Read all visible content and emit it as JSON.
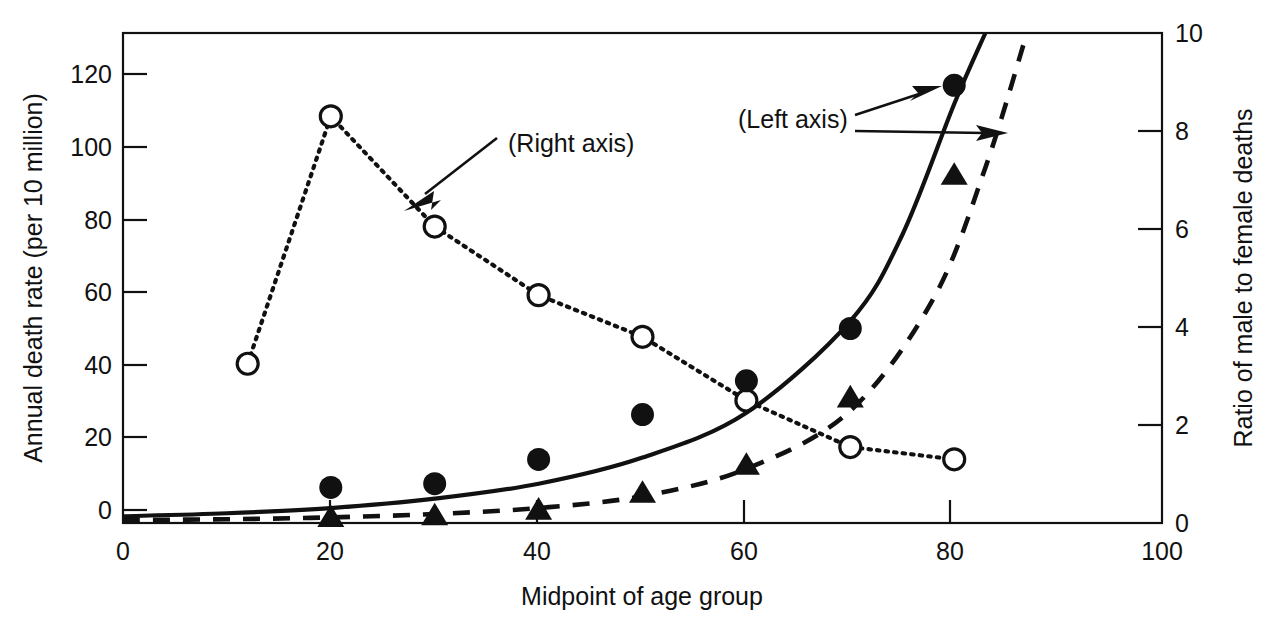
{
  "chart_data": {
    "type": "line",
    "title": "",
    "xlabel": "Midpoint of age group",
    "ylabel": "Annual death rate (per 10 million)",
    "y2label": "Ratio of male to female deaths",
    "xlim": [
      0,
      100
    ],
    "ylim": [
      0,
      131
    ],
    "y2lim": [
      0,
      10
    ],
    "xticks": [
      "0",
      "20",
      "40",
      "60",
      "80",
      "100"
    ],
    "xtick_values": [
      0,
      20,
      40,
      60,
      80,
      100
    ],
    "yticks": [
      "0",
      "20",
      "40",
      "60",
      "80",
      "100",
      "120"
    ],
    "ytick_values": [
      0,
      20,
      40,
      60,
      80,
      100,
      120
    ],
    "y2ticks": [
      "0",
      "2",
      "4",
      "6",
      "8",
      "10"
    ],
    "y2tick_values": [
      0,
      2,
      4,
      6,
      8,
      10
    ],
    "grid": false,
    "legend": "none",
    "annotations": [
      {
        "text": "(Right axis)",
        "points_to": "dotted-ratio-series"
      },
      {
        "text": "(Left axis)",
        "points_to": "solid-male-curve"
      },
      {
        "text": "(Left axis)",
        "points_to": "dashed-female-curve"
      }
    ],
    "series": [
      {
        "name": "Male death rate (points)",
        "axis": "left",
        "marker": "filled-circle",
        "line": "none",
        "x": [
          20,
          30,
          40,
          50,
          60,
          70,
          80
        ],
        "values": [
          9.5,
          10.5,
          17.0,
          29.0,
          38.0,
          52.0,
          117.0
        ]
      },
      {
        "name": "Male death rate (fitted)",
        "axis": "left",
        "marker": "none",
        "line": "solid",
        "x": [
          0,
          10,
          20,
          30,
          40,
          50,
          60,
          70,
          75,
          80,
          83
        ],
        "values": [
          1.8,
          2.6,
          4.0,
          6.5,
          10.5,
          17.5,
          29.5,
          54.0,
          77.0,
          112.0,
          131.0
        ]
      },
      {
        "name": "Female death rate (points)",
        "axis": "left",
        "marker": "filled-triangle",
        "line": "none",
        "x": [
          20,
          30,
          40,
          50,
          60,
          70,
          80
        ],
        "values": [
          1.5,
          2.0,
          3.5,
          8.0,
          15.5,
          33.5,
          93.0
        ]
      },
      {
        "name": "Female death rate (fitted)",
        "axis": "left",
        "marker": "none",
        "line": "dashed",
        "x": [
          0,
          10,
          20,
          30,
          40,
          50,
          60,
          70,
          78,
          83,
          87
        ],
        "values": [
          0.8,
          1.0,
          1.5,
          2.4,
          4.0,
          7.2,
          14.5,
          30.0,
          60.0,
          95.0,
          131.0
        ]
      },
      {
        "name": "Ratio of male to female deaths",
        "axis": "right",
        "marker": "open-circle",
        "line": "dotted",
        "x": [
          12,
          20,
          30,
          40,
          50,
          60,
          70,
          80
        ],
        "values": [
          3.25,
          8.3,
          6.05,
          4.65,
          3.8,
          2.5,
          1.55,
          1.3
        ]
      }
    ]
  }
}
